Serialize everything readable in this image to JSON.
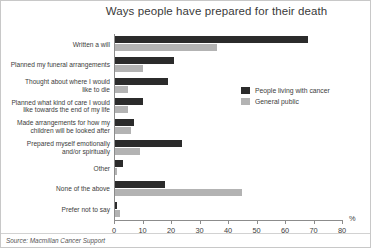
{
  "figure": {
    "title": "Ways people have prepared for their death",
    "source": "Source: Macmillan Cancer Support",
    "axis_unit": "%"
  },
  "legend": {
    "position": "inside-right",
    "items": [
      {
        "label": "People living with cancer",
        "color": "#2b2b2b"
      },
      {
        "label": "General public",
        "color": "#b3b3b3"
      }
    ]
  },
  "chart_data": {
    "type": "bar",
    "orientation": "horizontal",
    "title": "Ways people have prepared for their death",
    "xlabel": "%",
    "ylabel": "",
    "xlim": [
      0,
      80
    ],
    "xticks": [
      0,
      10,
      20,
      30,
      40,
      50,
      60,
      70,
      80
    ],
    "grid": false,
    "categories": [
      "Written a will",
      "Planned my funeral arrangements",
      "Thought about where I would like to die",
      "Planned what kind of care I would like towards the end of my life",
      "Made arrangements for how my children will be looked after",
      "Prepared myself emotionally and/or spiritually",
      "Other",
      "None of the above",
      "Prefer not to say"
    ],
    "categories_display": [
      [
        "Written a will"
      ],
      [
        "Planned my funeral arrangements"
      ],
      [
        "Thought about where I would",
        "like to die"
      ],
      [
        "Planned what kind of care I would",
        "like towards the end of my life"
      ],
      [
        "Made arrangements for how my",
        "children will be looked after"
      ],
      [
        "Prepared myself emotionally",
        "and/or spiritually"
      ],
      [
        "Other"
      ],
      [
        "None of the above"
      ],
      [
        "Prefer not to say"
      ]
    ],
    "series": [
      {
        "name": "People living with cancer",
        "color": "#2b2b2b",
        "values": [
          68,
          21,
          19,
          10,
          7,
          24,
          3,
          18,
          1
        ]
      },
      {
        "name": "General public",
        "color": "#b3b3b3",
        "values": [
          36,
          10,
          5,
          5,
          6,
          9,
          1,
          45,
          2
        ]
      }
    ]
  }
}
